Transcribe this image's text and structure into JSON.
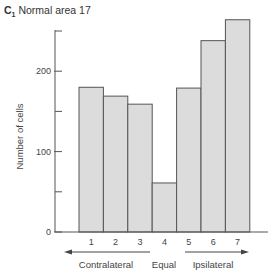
{
  "panel": {
    "label": "C",
    "sub": "1",
    "title": "Normal area 17"
  },
  "chart_data": {
    "type": "bar",
    "title": "Normal area 17",
    "categories": [
      "1",
      "2",
      "3",
      "4",
      "5",
      "6",
      "7"
    ],
    "values": [
      180,
      169,
      159,
      61,
      179,
      238,
      264
    ],
    "xlabel": "",
    "ylabel": "Number of cells",
    "ylim": [
      0,
      250
    ],
    "yticks_major": [
      0,
      100,
      200
    ],
    "yticks_minor": [
      50,
      150,
      250
    ],
    "grid": false,
    "group_labels": {
      "left": "Contralateral",
      "middle": "Equal",
      "right": "Ipsilateral"
    },
    "colors": {
      "bar_fill": "#dcdcdc",
      "bar_edge": "#555555",
      "axis": "#555555",
      "text": "#444444"
    }
  }
}
